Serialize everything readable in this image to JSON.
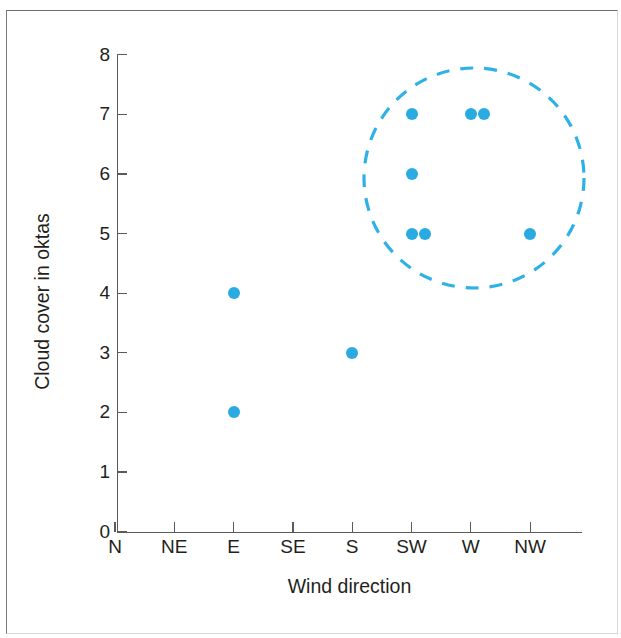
{
  "chart_data": {
    "type": "scatter",
    "title": "",
    "xlabel": "Wind direction",
    "ylabel": "Cloud cover in oktas",
    "x_categories": [
      "N",
      "NE",
      "E",
      "SE",
      "S",
      "SW",
      "W",
      "NW"
    ],
    "y_ticks": [
      0,
      1,
      2,
      3,
      4,
      5,
      6,
      7,
      8
    ],
    "ylim": [
      0,
      8
    ],
    "grid": false,
    "legend": "none",
    "point_color": "#29ABE2",
    "points": [
      {
        "x": "E",
        "x_index": 2,
        "y": 4
      },
      {
        "x": "E",
        "x_index": 2,
        "y": 2
      },
      {
        "x": "S",
        "x_index": 4,
        "y": 3
      },
      {
        "x": "SW",
        "x_index": 5,
        "y": 7
      },
      {
        "x": "SW",
        "x_index": 5,
        "y": 6
      },
      {
        "x": "SW",
        "x_index": 5,
        "y": 5
      },
      {
        "x": "SW",
        "x_index": 5,
        "y": 5
      },
      {
        "x": "W",
        "x_index": 6,
        "y": 7
      },
      {
        "x": "W",
        "x_index": 6,
        "y": 7
      },
      {
        "x": "NW",
        "x_index": 7,
        "y": 5
      }
    ],
    "annotations": [
      {
        "kind": "dashed-circle",
        "label": "cluster highlight",
        "center_x": "between SW and W",
        "center_y": 5.9,
        "color": "#2EB0E8",
        "style": "dashed"
      }
    ]
  },
  "axes": {
    "y_title": "Cloud cover in oktas",
    "x_title": "Wind direction",
    "y_tick_labels": [
      "8",
      "7",
      "6",
      "5",
      "4",
      "3",
      "2",
      "1",
      "0"
    ],
    "x_tick_labels": [
      "N",
      "NE",
      "E",
      "SE",
      "S",
      "SW",
      "W",
      "NW"
    ]
  },
  "colors": {
    "point": "#29ABE2",
    "circle": "#2EB0E8",
    "axis": "#5A5A5A",
    "text": "#231F20",
    "page_border": "#7B7B7B"
  }
}
